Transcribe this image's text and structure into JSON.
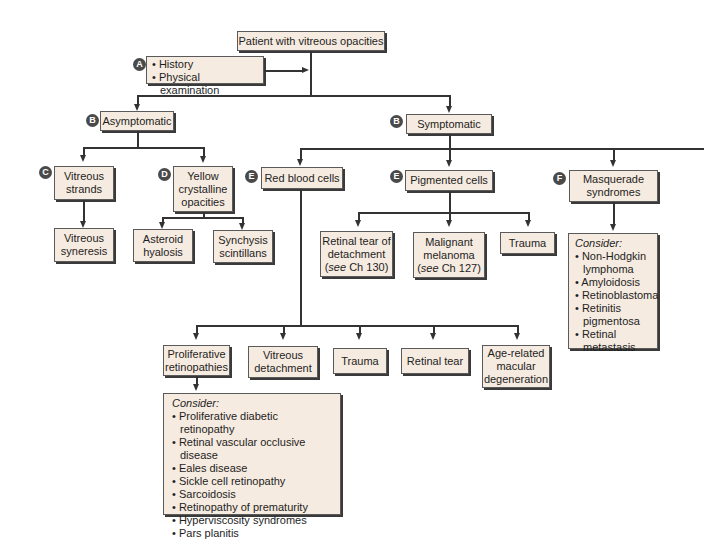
{
  "root": {
    "label": "Patient with vitreous opacities"
  },
  "step_a": {
    "badge": "A",
    "items": [
      "History",
      "Physical examination"
    ]
  },
  "asymptomatic": {
    "badge": "B",
    "label": "Asymptomatic",
    "vitreous_strands": {
      "badge": "C",
      "line1": "Vitreous",
      "line2": "strands",
      "child": {
        "line1": "Vitreous",
        "line2": "syneresis"
      }
    },
    "yellow": {
      "badge": "D",
      "line1": "Yellow",
      "line2": "crystalline",
      "line3": "opacities",
      "children": [
        {
          "line1": "Asteroid",
          "line2": "hyalosis"
        },
        {
          "line1": "Synchysis",
          "line2": "scintillans"
        }
      ]
    }
  },
  "symptomatic": {
    "badge": "B",
    "label": "Symptomatic",
    "red_blood_cells": {
      "badge": "E",
      "label": "Red blood cells",
      "children": [
        {
          "line1": "Proliferative",
          "line2": "retinopathies"
        },
        {
          "line1": "Vitreous",
          "line2": "detachment"
        },
        {
          "line1": "Trauma"
        },
        {
          "line1": "Retinal tear"
        },
        {
          "line1": "Age-related",
          "line2": "macular",
          "line3": "degeneration"
        }
      ],
      "consider": {
        "heading": "Consider:",
        "items": [
          "Proliferative diabetic retinopathy",
          "Retinal vascular occlusive disease",
          "Eales disease",
          "Sickle cell retinopathy",
          "Sarcoidosis",
          "Retinopathy of prematurity",
          "Hyperviscosity syndromes",
          "Pars planitis"
        ]
      }
    },
    "pigmented_cells": {
      "badge": "E",
      "label": "Pigmented cells",
      "children": [
        {
          "line1": "Retinal tear of",
          "line2": "detachment",
          "see": "see",
          "ref": " Ch 130)"
        },
        {
          "line1": "Malignant",
          "line2": "melanoma",
          "see": "see",
          "ref": " Ch 127)"
        },
        {
          "line1": "Trauma"
        }
      ]
    },
    "masquerade": {
      "badge": "F",
      "line1": "Masquerade",
      "line2": "syndromes",
      "consider": {
        "heading": "Consider:",
        "items": [
          "Non-Hodgkin lymphoma",
          "Amyloidosis",
          "Retinoblastoma",
          "Retinitis pigmentosa",
          "Retinal metastasis"
        ]
      }
    }
  }
}
